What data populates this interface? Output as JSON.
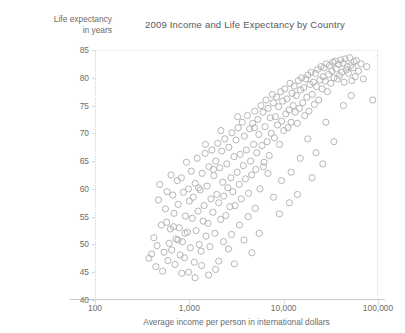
{
  "chart_data": {
    "type": "scatter",
    "title": "2009 Income and Life Expectancy by Country",
    "xlabel": "Average income per person in international dollars",
    "ylabel": "Life expectancy\nin years",
    "ylabel_line1": "Life expectancy",
    "ylabel_line2": "in years",
    "xscale": "log",
    "yscale": "linear",
    "xlim": [
      100,
      100000
    ],
    "ylim": [
      40,
      85
    ],
    "xticks": [
      100,
      1000,
      10000,
      100000
    ],
    "xticklabels": [
      "100",
      "1,000",
      "10,000",
      "100,000"
    ],
    "yticks": [
      40,
      45,
      50,
      55,
      60,
      65,
      70,
      75,
      80,
      85
    ],
    "yticklabels": [
      "40",
      "45",
      "50",
      "55",
      "60",
      "65",
      "70",
      "75",
      "80",
      "85"
    ],
    "grid": false,
    "legend": null,
    "marker": {
      "shape": "open-circle",
      "stroke_color": "#b6b6b8",
      "fill": "none",
      "radius_px": 3.1
    },
    "colors": {
      "text": "#6b6b6d",
      "title": "#58585a",
      "axis": "#c9c9cb",
      "frame": "#d3d3d5",
      "background": "#ffffff"
    },
    "series": [
      {
        "name": "Countries",
        "points": [
          [
            372,
            47.5
          ],
          [
            398,
            48.3
          ],
          [
            420,
            51.2
          ],
          [
            441,
            46.0
          ],
          [
            455,
            49.8
          ],
          [
            470,
            58.0
          ],
          [
            486,
            60.8
          ],
          [
            505,
            53.5
          ],
          [
            521,
            45.2
          ],
          [
            540,
            48.6
          ],
          [
            558,
            56.4
          ],
          [
            575,
            54.0
          ],
          [
            592,
            47.1
          ],
          [
            611,
            50.2
          ],
          [
            630,
            52.8
          ],
          [
            650,
            49.0
          ],
          [
            668,
            58.9
          ],
          [
            688,
            55.6
          ],
          [
            705,
            46.4
          ],
          [
            724,
            51.0
          ],
          [
            744,
            61.5
          ],
          [
            762,
            57.2
          ],
          [
            781,
            53.0
          ],
          [
            800,
            48.1
          ],
          [
            822,
            62.0
          ],
          [
            845,
            50.5
          ],
          [
            866,
            59.4
          ],
          [
            888,
            47.6
          ],
          [
            910,
            55.1
          ],
          [
            932,
            64.8
          ],
          [
            955,
            52.2
          ],
          [
            978,
            60.0
          ],
          [
            1000,
            57.8
          ],
          [
            1025,
            49.4
          ],
          [
            1050,
            63.2
          ],
          [
            1075,
            54.7
          ],
          [
            1100,
            58.5
          ],
          [
            1128,
            46.8
          ],
          [
            1155,
            61.0
          ],
          [
            1182,
            52.5
          ],
          [
            1210,
            65.5
          ],
          [
            1240,
            56.0
          ],
          [
            1270,
            50.0
          ],
          [
            1300,
            59.8
          ],
          [
            1332,
            48.8
          ],
          [
            1365,
            62.8
          ],
          [
            1400,
            54.2
          ],
          [
            1435,
            57.0
          ],
          [
            1470,
            66.4
          ],
          [
            1505,
            51.5
          ],
          [
            1540,
            60.5
          ],
          [
            1578,
            53.8
          ],
          [
            1615,
            64.0
          ],
          [
            1655,
            49.6
          ],
          [
            1695,
            58.2
          ],
          [
            1735,
            67.0
          ],
          [
            1778,
            55.8
          ],
          [
            1820,
            62.4
          ],
          [
            1865,
            52.0
          ],
          [
            1910,
            65.0
          ],
          [
            1955,
            59.0
          ],
          [
            2000,
            68.2
          ],
          [
            2050,
            57.5
          ],
          [
            2100,
            63.8
          ],
          [
            2150,
            54.5
          ],
          [
            2205,
            66.8
          ],
          [
            2260,
            61.2
          ],
          [
            2315,
            58.7
          ],
          [
            2375,
            69.0
          ],
          [
            2435,
            55.2
          ],
          [
            2495,
            64.5
          ],
          [
            2560,
            60.2
          ],
          [
            2625,
            67.5
          ],
          [
            2690,
            56.8
          ],
          [
            2760,
            62.0
          ],
          [
            2830,
            70.1
          ],
          [
            2900,
            59.5
          ],
          [
            2975,
            65.8
          ],
          [
            3050,
            57.0
          ],
          [
            3130,
            68.8
          ],
          [
            3210,
            63.0
          ],
          [
            3290,
            71.0
          ],
          [
            3375,
            60.8
          ],
          [
            3460,
            66.2
          ],
          [
            3550,
            58.2
          ],
          [
            3640,
            72.0
          ],
          [
            3735,
            64.2
          ],
          [
            3830,
            69.5
          ],
          [
            3930,
            61.8
          ],
          [
            4030,
            67.0
          ],
          [
            4130,
            73.2
          ],
          [
            4240,
            59.2
          ],
          [
            4350,
            70.8
          ],
          [
            4460,
            65.0
          ],
          [
            4575,
            62.5
          ],
          [
            4690,
            71.8
          ],
          [
            4810,
            68.0
          ],
          [
            4935,
            74.0
          ],
          [
            5060,
            63.5
          ],
          [
            5190,
            66.5
          ],
          [
            5325,
            72.5
          ],
          [
            5460,
            69.8
          ],
          [
            5600,
            60.0
          ],
          [
            5745,
            75.0
          ],
          [
            5890,
            67.8
          ],
          [
            6040,
            73.8
          ],
          [
            6195,
            64.8
          ],
          [
            6355,
            71.2
          ],
          [
            6520,
            76.0
          ],
          [
            6685,
            68.5
          ],
          [
            6855,
            74.5
          ],
          [
            7030,
            66.0
          ],
          [
            7210,
            72.8
          ],
          [
            7395,
            70.0
          ],
          [
            7585,
            77.0
          ],
          [
            7780,
            75.5
          ],
          [
            7980,
            69.2
          ],
          [
            8185,
            73.0
          ],
          [
            8395,
            76.5
          ],
          [
            8610,
            71.5
          ],
          [
            8830,
            74.8
          ],
          [
            9055,
            68.0
          ],
          [
            9290,
            77.5
          ],
          [
            9525,
            72.2
          ],
          [
            9770,
            75.8
          ],
          [
            10020,
            70.5
          ],
          [
            10275,
            78.0
          ],
          [
            10540,
            73.5
          ],
          [
            10810,
            76.2
          ],
          [
            11090,
            71.0
          ],
          [
            11375,
            74.2
          ],
          [
            11670,
            79.0
          ],
          [
            11970,
            72.0
          ],
          [
            12280,
            77.2
          ],
          [
            12600,
            75.0
          ],
          [
            12925,
            78.5
          ],
          [
            13260,
            73.8
          ],
          [
            13605,
            76.8
          ],
          [
            13960,
            71.8
          ],
          [
            14320,
            79.5
          ],
          [
            14695,
            74.5
          ],
          [
            15080,
            77.8
          ],
          [
            15475,
            80.0
          ],
          [
            15880,
            75.5
          ],
          [
            16295,
            78.2
          ],
          [
            16725,
            73.2
          ],
          [
            17165,
            79.8
          ],
          [
            17620,
            76.5
          ],
          [
            18085,
            80.5
          ],
          [
            18565,
            74.0
          ],
          [
            19055,
            78.8
          ],
          [
            19560,
            81.0
          ],
          [
            20080,
            77.0
          ],
          [
            20615,
            79.2
          ],
          [
            21165,
            75.2
          ],
          [
            21730,
            80.8
          ],
          [
            22315,
            78.4
          ],
          [
            22910,
            81.5
          ],
          [
            23525,
            76.0
          ],
          [
            24160,
            79.6
          ],
          [
            24810,
            82.0
          ],
          [
            25480,
            78.0
          ],
          [
            26170,
            80.2
          ],
          [
            26875,
            81.8
          ],
          [
            27605,
            79.4
          ],
          [
            28350,
            82.5
          ],
          [
            29120,
            77.5
          ],
          [
            29910,
            80.6
          ],
          [
            30725,
            82.2
          ],
          [
            31560,
            79.0
          ],
          [
            32420,
            81.2
          ],
          [
            33305,
            82.8
          ],
          [
            34215,
            80.0
          ],
          [
            35150,
            83.0
          ],
          [
            36110,
            81.6
          ],
          [
            37100,
            79.8
          ],
          [
            38115,
            82.4
          ],
          [
            39160,
            80.4
          ],
          [
            40235,
            83.2
          ],
          [
            41340,
            81.0
          ],
          [
            42475,
            82.6
          ],
          [
            43640,
            79.2
          ],
          [
            44840,
            83.4
          ],
          [
            46070,
            81.4
          ],
          [
            47340,
            82.0
          ],
          [
            48645,
            80.8
          ],
          [
            49985,
            83.6
          ],
          [
            51365,
            82.2
          ],
          [
            52785,
            79.5
          ],
          [
            54245,
            81.8
          ],
          [
            55750,
            82.9
          ],
          [
            57295,
            80.2
          ],
          [
            58885,
            83.1
          ],
          [
            62000,
            81.2
          ],
          [
            66000,
            82.5
          ],
          [
            70000,
            79.8
          ],
          [
            76000,
            82.0
          ],
          [
            88000,
            76.0
          ],
          [
            34000,
            68.5
          ],
          [
            28000,
            72.0
          ],
          [
            22000,
            66.5
          ],
          [
            18000,
            69.0
          ],
          [
            15000,
            65.5
          ],
          [
            12000,
            63.0
          ],
          [
            9500,
            61.5
          ],
          [
            7800,
            58.5
          ],
          [
            6100,
            64.0
          ],
          [
            5000,
            56.5
          ],
          [
            4200,
            55.0
          ],
          [
            3400,
            53.5
          ],
          [
            2800,
            51.8
          ],
          [
            2300,
            50.5
          ],
          [
            1900,
            45.5
          ],
          [
            1600,
            44.5
          ],
          [
            1350,
            46.2
          ],
          [
            1150,
            44.0
          ],
          [
            980,
            45.0
          ],
          [
            830,
            44.8
          ],
          [
            2050,
            47.0
          ],
          [
            2600,
            49.2
          ],
          [
            3000,
            46.5
          ],
          [
            3800,
            50.8
          ],
          [
            4600,
            48.5
          ],
          [
            5500,
            52.0
          ],
          [
            9000,
            55.5
          ],
          [
            11500,
            57.5
          ],
          [
            14000,
            59.0
          ],
          [
            20000,
            62.0
          ],
          [
            26000,
            64.5
          ],
          [
            43000,
            75.0
          ],
          [
            52000,
            76.8
          ],
          [
            640,
            62.5
          ],
          [
            580,
            59.5
          ],
          [
            1480,
            68.0
          ],
          [
            2160,
            70.5
          ],
          [
            3250,
            73.0
          ],
          [
            4900,
            71.0
          ],
          [
            6800,
            62.8
          ],
          [
            1800,
            63.5
          ],
          [
            1250,
            60.2
          ],
          [
            900,
            52.0
          ],
          [
            760,
            50.8
          ],
          [
            680,
            53.2
          ]
        ]
      }
    ]
  }
}
